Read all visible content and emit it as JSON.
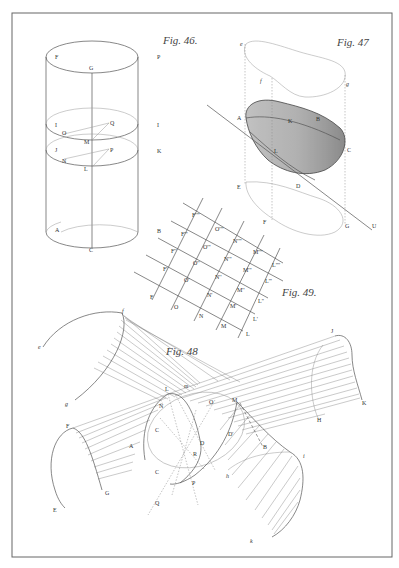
{
  "plate": {
    "frame": {
      "x": 12,
      "y": 13,
      "width": 380,
      "height": 544
    },
    "ink_color": "#555555",
    "paper_color": "#ffffff"
  },
  "fig46": {
    "title": "Fig. 46.",
    "labels": {
      "F": "F",
      "G": "G",
      "P": "P",
      "I": "I",
      "O": "O",
      "Q": "Q",
      "M": "M",
      "Ilower": "I",
      "J": "J",
      "N": "N",
      "Pmid": "P",
      "L": "L",
      "K": "K",
      "A": "A",
      "B": "B",
      "C": "C"
    }
  },
  "fig47": {
    "title": "Fig. 47",
    "labels": {
      "e": "e",
      "f": "f",
      "g": "g",
      "A": "A",
      "K": "K",
      "B": "B",
      "L": "L",
      "C": "C",
      "E": "E",
      "D": "D",
      "F": "F",
      "G": "G",
      "U": "U"
    }
  },
  "fig49": {
    "title": "Fig. 49.",
    "grid_labels": {
      "F": [
        "F",
        "F'",
        "F''",
        "F'''",
        "F''''"
      ],
      "O": [
        "O",
        "O'",
        "O''",
        "O'''",
        "O''''"
      ],
      "N": [
        "N",
        "N'",
        "N''",
        "N'''",
        "N''''"
      ],
      "M": [
        "M",
        "M'",
        "M''",
        "M'''",
        "M''''"
      ],
      "L": [
        "L",
        "L'",
        "L''",
        "L'''",
        "L''''"
      ]
    }
  },
  "fig48": {
    "title": "Fig. 48",
    "labels": {
      "e": "e",
      "f": "f",
      "g": "g",
      "F": "F",
      "E": "E",
      "G": "G",
      "A": "A",
      "L": "L",
      "m": "m",
      "N": "N",
      "O": "O",
      "M": "M",
      "C1": "C",
      "C2": "C",
      "D": "D",
      "D2": "D'",
      "R": "R",
      "P": "P",
      "Q": "Q",
      "J": "J",
      "H": "H",
      "K": "K",
      "h": "h",
      "i": "i",
      "k": "k",
      "B": "B"
    }
  }
}
